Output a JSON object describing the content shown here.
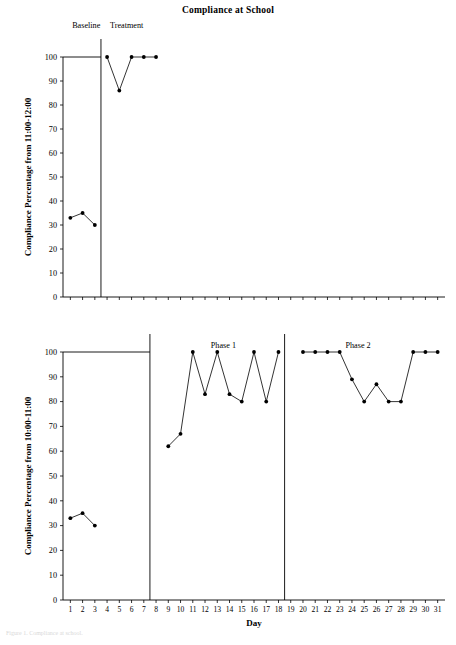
{
  "figure": {
    "title": "Compliance at School",
    "footnote": "Figure 1. Compliance at school."
  },
  "chart_data": [
    {
      "type": "line",
      "id": "top-panel",
      "title": "Compliance at School",
      "xlabel": "",
      "ylabel": "Compliance Percentage from 11:00-12:00",
      "xlim": [
        0.4,
        31.6
      ],
      "ylim": [
        0,
        100
      ],
      "yticks": [
        0,
        10,
        20,
        30,
        40,
        50,
        60,
        70,
        80,
        90,
        100
      ],
      "xticks": [
        1,
        2,
        3,
        4,
        5,
        6,
        7,
        8,
        9,
        10,
        11,
        12,
        13,
        14,
        15,
        16,
        17,
        18,
        19,
        20,
        21,
        22,
        23,
        24,
        25,
        26,
        27,
        28,
        29,
        30,
        31
      ],
      "grid": false,
      "legend": "none",
      "phase_labels": [
        {
          "text": "Baseline",
          "x": 2.3
        },
        {
          "text": "Treatment",
          "x": 5.6
        }
      ],
      "phase_dividers": [
        3.5
      ],
      "series": [
        {
          "name": "Baseline",
          "x": [
            1,
            2,
            3
          ],
          "values": [
            33,
            35,
            30
          ]
        },
        {
          "name": "Treatment",
          "x": [
            4,
            5,
            6,
            7,
            8
          ],
          "values": [
            100,
            86,
            100,
            100,
            100
          ]
        }
      ]
    },
    {
      "type": "line",
      "id": "bottom-panel",
      "title": "",
      "xlabel": "Day",
      "ylabel": "Compliance Percentage from 10:00-11:00",
      "xlim": [
        0.4,
        31.6
      ],
      "ylim": [
        0,
        100
      ],
      "yticks": [
        0,
        10,
        20,
        30,
        40,
        50,
        60,
        70,
        80,
        90,
        100
      ],
      "xticks": [
        1,
        2,
        3,
        4,
        5,
        6,
        7,
        8,
        9,
        10,
        11,
        12,
        13,
        14,
        15,
        16,
        17,
        18,
        19,
        20,
        21,
        22,
        23,
        24,
        25,
        26,
        27,
        28,
        29,
        30,
        31
      ],
      "grid": false,
      "legend": "none",
      "phase_labels": [
        {
          "text": "Phase 1",
          "x": 13.5
        },
        {
          "text": "Phase 2",
          "x": 24.5
        }
      ],
      "phase_dividers": [
        7.5,
        18.5
      ],
      "series": [
        {
          "name": "Baseline",
          "x": [
            1,
            2,
            3
          ],
          "values": [
            33,
            35,
            30
          ]
        },
        {
          "name": "Phase 1",
          "x": [
            9,
            10,
            11,
            12,
            13,
            14,
            15,
            16,
            17,
            18
          ],
          "values": [
            62,
            67,
            100,
            83,
            100,
            83,
            80,
            100,
            80,
            100
          ]
        },
        {
          "name": "Phase 2",
          "x": [
            20,
            21,
            22,
            23,
            24,
            25,
            26,
            27,
            28,
            29,
            30,
            31
          ],
          "values": [
            100,
            100,
            100,
            100,
            89,
            80,
            87,
            80,
            80,
            100,
            100,
            100
          ]
        }
      ]
    }
  ],
  "style": {
    "line_color": "#000000",
    "marker_color": "#000000",
    "axis_color": "#000000",
    "background": "#ffffff"
  }
}
